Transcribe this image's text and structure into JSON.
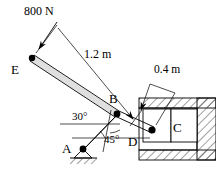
{
  "figure": {
    "type": "engineering-statics-free-body-diagram",
    "background_color": "#ffffff",
    "line_color": "#000000",
    "hatch_color": "#555555"
  },
  "labels": {
    "load": "800 N",
    "dim_long": "1.2 m",
    "dim_short": "0.4 m",
    "point_e": "E",
    "point_b": "B",
    "point_a": "A",
    "point_d": "D",
    "point_c": "C",
    "angle_30": "30°",
    "angle_45": "45°"
  },
  "geometry": {
    "point_e": [
      32,
      58
    ],
    "point_b": [
      117,
      114
    ],
    "point_a": [
      83,
      149
    ],
    "point_d": [
      152,
      130
    ],
    "dim_line_start": [
      36,
      52
    ],
    "dim_tick_mid": [
      136,
      117
    ],
    "dim_line_end": [
      172,
      96
    ],
    "load_arrow_tail": [
      57,
      22
    ],
    "load_arrow_head": [
      36,
      52
    ],
    "angle_30_vertex": [
      117,
      114
    ],
    "angle_45_vertex": [
      83,
      149
    ],
    "cylinder_outer": [
      139,
      98,
      77,
      62
    ],
    "piston_block": [
      143,
      108,
      28,
      34
    ]
  },
  "annotations": {
    "bar_eba_angle_deg": 30,
    "link_ab_angle_deg": 45,
    "load_magnitude_n": 800,
    "length_eb_m": 1.2,
    "length_bd_m": 0.4
  }
}
